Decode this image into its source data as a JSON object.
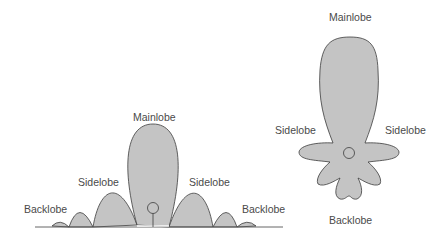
{
  "colors": {
    "lobe_fill": "#c4c4c4",
    "lobe_stroke": "#3c3c3c",
    "label_text": "#4a4a4a",
    "ground_line": "#555555"
  },
  "diagrams": [
    {
      "name": "rectangular-radiation-pattern",
      "labels": {
        "mainlobe": "Mainlobe",
        "sidelobe_left": "Sidelobe",
        "sidelobe_right": "Sidelobe",
        "backlobe_left": "Backlobe",
        "backlobe_right": "Backlobe"
      }
    },
    {
      "name": "polar-radiation-pattern",
      "labels": {
        "mainlobe": "Mainlobe",
        "sidelobe_left": "Sidelobe",
        "sidelobe_right": "Sidelobe",
        "backlobe": "Backlobe"
      }
    }
  ]
}
